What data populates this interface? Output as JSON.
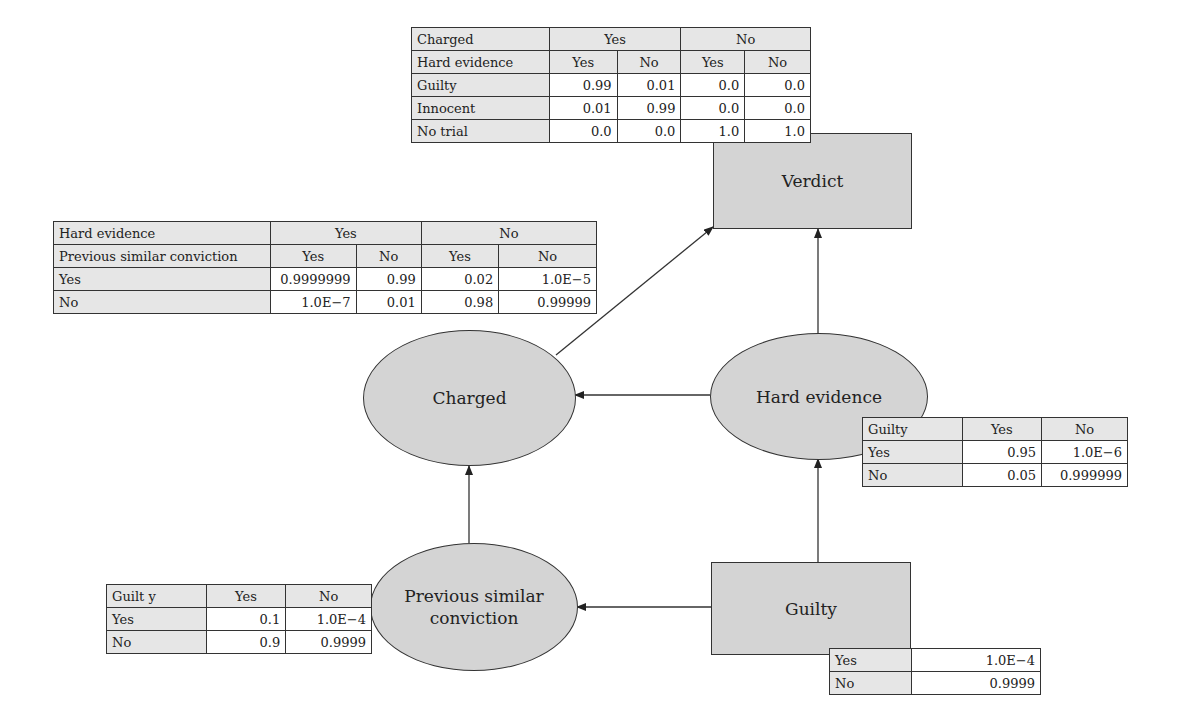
{
  "nodes": {
    "verdict": {
      "label": "Verdict",
      "shape": "rectangle"
    },
    "charged": {
      "label": "Charged",
      "shape": "ellipse"
    },
    "hard_evidence": {
      "label": "Hard evidence",
      "shape": "ellipse"
    },
    "previous_conviction": {
      "label_line1": "Previous similar",
      "label_line2": "conviction",
      "shape": "ellipse"
    },
    "guilty": {
      "label": "Guilty",
      "shape": "rectangle"
    }
  },
  "edges": [
    {
      "from": "Charged",
      "to": "Verdict"
    },
    {
      "from": "Hard evidence",
      "to": "Verdict"
    },
    {
      "from": "Hard evidence",
      "to": "Charged"
    },
    {
      "from": "Previous similar conviction",
      "to": "Charged"
    },
    {
      "from": "Guilty",
      "to": "Hard evidence"
    },
    {
      "from": "Guilty",
      "to": "Previous similar conviction"
    }
  ],
  "tables": {
    "verdict": {
      "h1_label": "Charged",
      "h1_yes": "Yes",
      "h1_no": "No",
      "h2_label": "Hard evidence",
      "h2": [
        "Yes",
        "No",
        "Yes",
        "No"
      ],
      "rows": [
        {
          "label": "Guilty",
          "values": [
            "0.99",
            "0.01",
            "0.0",
            "0.0"
          ]
        },
        {
          "label": "Innocent",
          "values": [
            "0.01",
            "0.99",
            "0.0",
            "0.0"
          ]
        },
        {
          "label": "No trial",
          "values": [
            "0.0",
            "0.0",
            "1.0",
            "1.0"
          ]
        }
      ]
    },
    "charged": {
      "h1_label": "Hard evidence",
      "h1_yes": "Yes",
      "h1_no": "No",
      "h2_label": "Previous similar conviction",
      "h2": [
        "Yes",
        "No",
        "Yes",
        "No"
      ],
      "rows": [
        {
          "label": "Yes",
          "values": [
            "0.9999999",
            "0.99",
            "0.02",
            "1.0E−5"
          ]
        },
        {
          "label": "No",
          "values": [
            "1.0E−7",
            "0.01",
            "0.98",
            "0.99999"
          ]
        }
      ]
    },
    "hard_evidence": {
      "header": [
        "Guilty",
        "Yes",
        "No"
      ],
      "rows": [
        {
          "label": "Yes",
          "values": [
            "0.95",
            "1.0E−6"
          ]
        },
        {
          "label": "No",
          "values": [
            "0.05",
            "0.999999"
          ]
        }
      ]
    },
    "previous_conviction": {
      "header": [
        "Guilt y",
        "Yes",
        "No"
      ],
      "rows": [
        {
          "label": "Yes",
          "values": [
            "0.1",
            "1.0E−4"
          ]
        },
        {
          "label": "No",
          "values": [
            "0.9",
            "0.9999"
          ]
        }
      ]
    },
    "guilty": {
      "rows": [
        {
          "label": "Yes",
          "value": "1.0E−4"
        },
        {
          "label": "No",
          "value": "0.9999"
        }
      ]
    }
  }
}
